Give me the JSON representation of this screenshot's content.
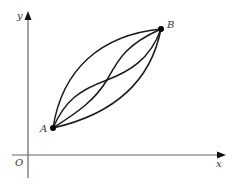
{
  "diagram": {
    "axes": {
      "x_label": "x",
      "y_label": "y",
      "origin_label": "O",
      "color": "#555555"
    },
    "points": {
      "A": {
        "label": "A",
        "x": 53,
        "y": 128
      },
      "B": {
        "label": "B",
        "x": 161,
        "y": 29
      }
    },
    "curves": [
      {
        "name": "upper-bulge-curve",
        "description": "convex path from A to B bulging toward upper-left"
      },
      {
        "name": "s-curve-1",
        "description": "S-shaped path from A to B through center crossing"
      },
      {
        "name": "s-curve-2",
        "description": "S-shaped path from A to B through center crossing"
      },
      {
        "name": "lower-bulge-curve",
        "description": "convex path from A to B bulging toward lower-right"
      }
    ],
    "curve_color": "#1a1a1a",
    "point_color": "#000000"
  }
}
